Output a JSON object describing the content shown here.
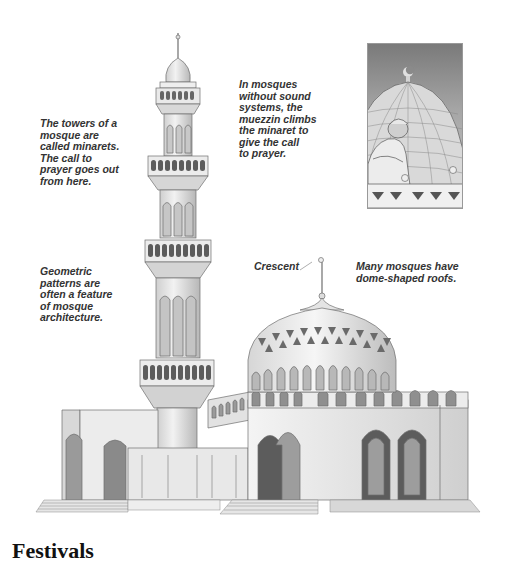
{
  "captions": {
    "minarets": [
      "The towers of a",
      "mosque are",
      "called minarets.",
      "The call to",
      "prayer goes out",
      "from here."
    ],
    "muezzin": [
      "In mosques",
      "without sound",
      "systems, the",
      "muezzin climbs",
      "the minaret to",
      "give the call",
      "to prayer."
    ],
    "geometric": [
      "Geometric",
      "patterns are",
      "often a feature",
      "of mosque",
      "architecture."
    ],
    "domes": [
      "Many mosques have",
      "dome-shaped roofs."
    ],
    "crescent_label": "Crescent"
  },
  "section_heading": "Festivals",
  "illustrations": {
    "main": "mosque-with-minaret-and-dome",
    "inset": "muezzin-calling-before-dome"
  },
  "colors": {
    "text": "#333333",
    "line": "#6f6f6f",
    "wall": "#e4e4e4",
    "shadow": "#9a9a9a",
    "dark": "#5c5c5c"
  }
}
